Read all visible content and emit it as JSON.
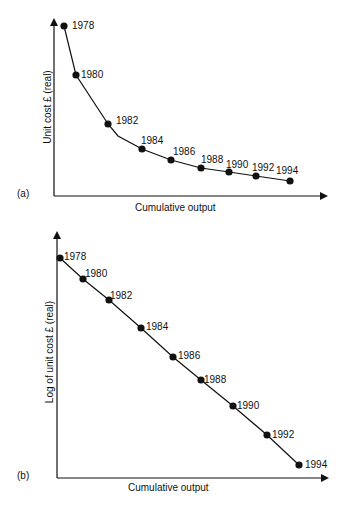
{
  "chart_data": [
    {
      "panel": "(a)",
      "type": "line",
      "title": "",
      "xlabel": "Cumulative output",
      "ylabel": "Unit cost £ (real)",
      "categories": [
        "1978",
        "1980",
        "1982",
        "1984",
        "1986",
        "1988",
        "1990",
        "1992",
        "1994"
      ],
      "x": [
        10,
        22,
        54,
        88,
        117,
        147,
        175,
        202,
        236
      ],
      "values": [
        169,
        120,
        71,
        46,
        35,
        27,
        23,
        19,
        14
      ],
      "grid": false,
      "legend": null,
      "note": "Experience curve: unit cost falls steeply then flattens as cumulative output grows; axes unscaled (values are relative pixel estimates)"
    },
    {
      "panel": "(b)",
      "type": "line",
      "title": "",
      "xlabel": "Cumulative output",
      "ylabel": "Log of unit cost £ (real)",
      "categories": [
        "1978",
        "1980",
        "1982",
        "1984",
        "1986",
        "1988",
        "1990",
        "1992",
        "1994"
      ],
      "x": [
        3,
        26,
        52,
        84,
        116,
        144,
        176,
        210,
        242
      ],
      "values": [
        219,
        198,
        177,
        149,
        120,
        97,
        71,
        42,
        12
      ],
      "grid": false,
      "legend": null,
      "note": "Log of unit cost declines linearly with cumulative output; axes unscaled (values are relative pixel estimates)"
    }
  ],
  "panels": {
    "a": {
      "tag": "(a)",
      "xlabel": "Cumulative output",
      "ylabel": "Unit cost £ (real)",
      "points": [
        {
          "year": "1978",
          "px": 64,
          "py": 26,
          "lx": 72,
          "ly": 29
        },
        {
          "year": "1980",
          "px": 76,
          "py": 75,
          "lx": 81,
          "ly": 78
        },
        {
          "year": "1982",
          "px": 108,
          "py": 124,
          "lx": 116,
          "ly": 124
        },
        {
          "year": "1984",
          "px": 142,
          "py": 149,
          "lx": 141,
          "ly": 144
        },
        {
          "year": "1986",
          "px": 171,
          "py": 160,
          "lx": 173,
          "ly": 155
        },
        {
          "year": "1988",
          "px": 201,
          "py": 168,
          "lx": 201,
          "ly": 163
        },
        {
          "year": "1990",
          "px": 229,
          "py": 172,
          "lx": 226,
          "ly": 168
        },
        {
          "year": "1992",
          "px": 256,
          "py": 176,
          "lx": 252,
          "ly": 171
        },
        {
          "year": "1994",
          "px": 290,
          "py": 181,
          "lx": 276,
          "ly": 174
        }
      ]
    },
    "b": {
      "tag": "(b)",
      "xlabel": "Cumulative output",
      "ylabel": "Log of unit cost £ (real)",
      "points": [
        {
          "year": "1978",
          "px": 60,
          "py": 258,
          "lx": 64,
          "ly": 260
        },
        {
          "year": "1980",
          "px": 83,
          "py": 279,
          "lx": 85,
          "ly": 277
        },
        {
          "year": "1982",
          "px": 109,
          "py": 300,
          "lx": 110,
          "ly": 299
        },
        {
          "year": "1984",
          "px": 141,
          "py": 328,
          "lx": 146,
          "ly": 330
        },
        {
          "year": "1986",
          "px": 173,
          "py": 357,
          "lx": 178,
          "ly": 359
        },
        {
          "year": "1988",
          "px": 201,
          "py": 380,
          "lx": 204,
          "ly": 383
        },
        {
          "year": "1990",
          "px": 233,
          "py": 406,
          "lx": 237,
          "ly": 409
        },
        {
          "year": "1992",
          "px": 267,
          "py": 435,
          "lx": 272,
          "ly": 438
        },
        {
          "year": "1994",
          "px": 299,
          "py": 465,
          "lx": 305,
          "ly": 468
        }
      ]
    }
  }
}
